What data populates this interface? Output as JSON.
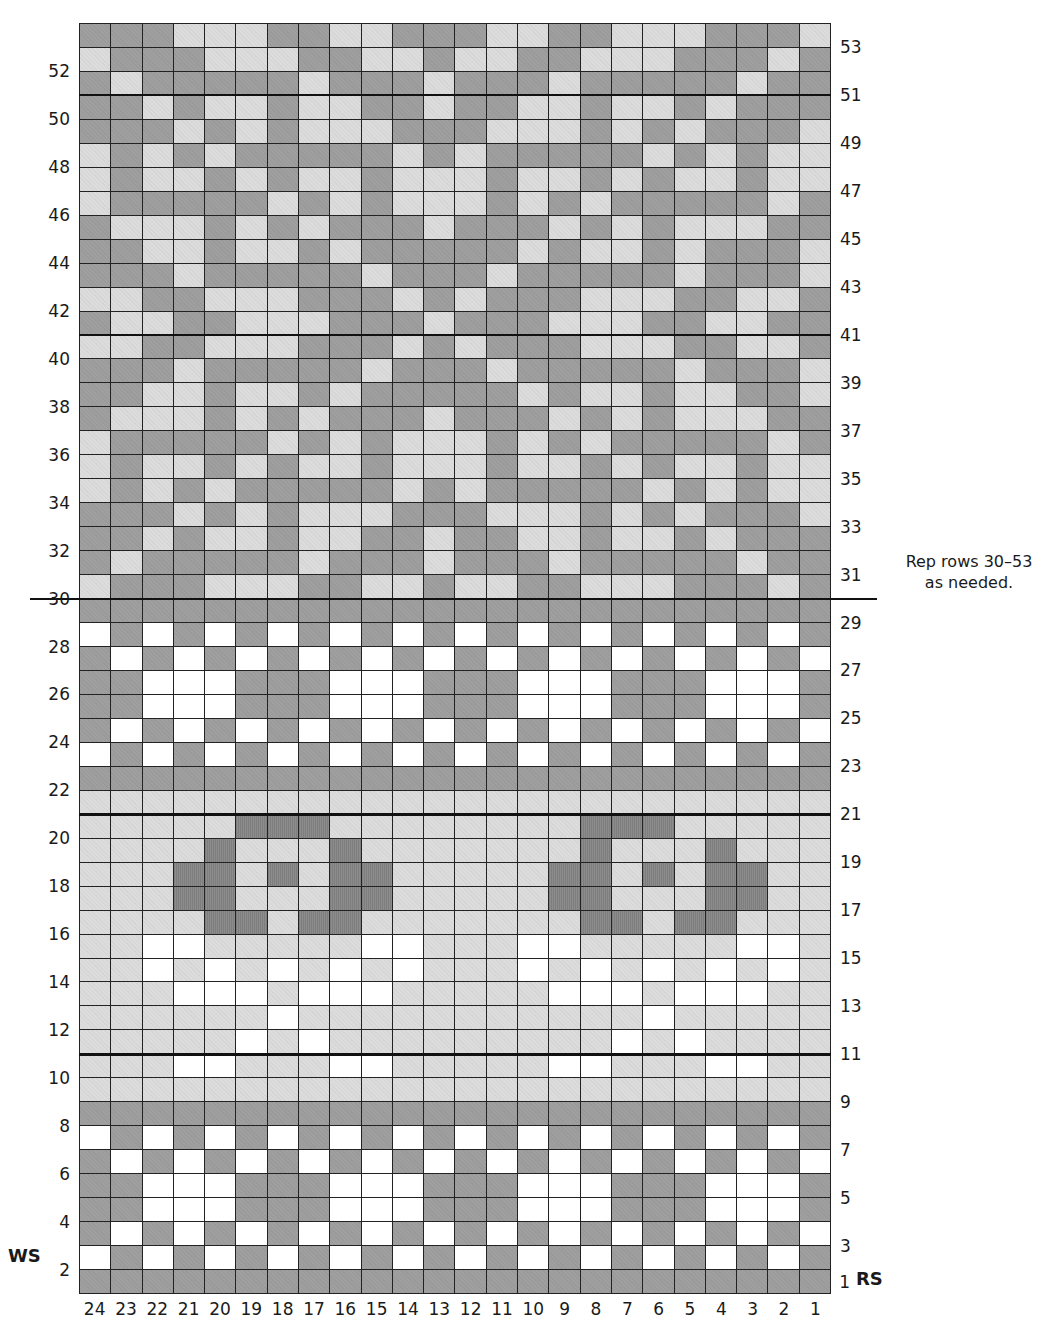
{
  "colors": {
    "D": "#9f9f9f",
    "L": "#dcdcdc",
    "W": "#ffffff",
    "X": "#8c8c8c",
    "grid_line": "#222222"
  },
  "legend_keys": {
    "D": "medium-dark grey",
    "L": "light grey",
    "W": "white",
    "X": "dark grey (hatched)"
  },
  "chart": {
    "columns": 24,
    "rows": 53,
    "column_order_left_to_right": [
      24,
      23,
      22,
      21,
      20,
      19,
      18,
      17,
      16,
      15,
      14,
      13,
      12,
      11,
      10,
      9,
      8,
      7,
      6,
      5,
      4,
      3,
      2,
      1
    ],
    "rows_top_to_bottom": [
      {
        "row": 53,
        "cells": "DDDLLLDDLLDDDLLDDLLLDDDL"
      },
      {
        "row": 52,
        "cells": "LDDDLLLDDLLDLLDDLLLDDDLD"
      },
      {
        "row": 51,
        "cells": "DLDDDDDLDDDLDDDLDDDDDLDD"
      },
      {
        "row": 50,
        "cells": "DDLDLLDLLDDLDDLLDLLDLDDD"
      },
      {
        "row": 49,
        "cells": "DDDLDLDLLLDDDLLLDLDLDDDL"
      },
      {
        "row": 48,
        "cells": "LDLDLDDDDDLDLDDDDDLDLDLL"
      },
      {
        "row": 47,
        "cells": "LDLLDLDLLDLLLDLLDLDLLDLL"
      },
      {
        "row": 46,
        "cells": "LDDDDDLDLDLLLDLDLDDDDDLD"
      },
      {
        "row": 45,
        "cells": "DLLLDLDLDDDLDDDLDLDLLLDD"
      },
      {
        "row": 44,
        "cells": "DDLLDLLDLDDDDDLDLLDLDDDL"
      },
      {
        "row": 43,
        "cells": "DDDLDDDDDLDDDLDDDDDLDDDL"
      },
      {
        "row": 42,
        "cells": "LLDDLLLDDDLDLDDDLLLDDLLD"
      },
      {
        "row": 41,
        "cells": "DLLDDLLLDDDLDDDLLLDDLLDD"
      },
      {
        "row": 40,
        "cells": "LLDDLLLDDDLDLDDDLLLDDLLD"
      },
      {
        "row": 39,
        "cells": "DDDLDDDDDLDDDLDDDDDLDDDL"
      },
      {
        "row": 38,
        "cells": "DDLLDLLDLDDDDDLDLLDLLDDL"
      },
      {
        "row": 37,
        "cells": "DLLLDLDLDDDLDDDLDLDLLLDD"
      },
      {
        "row": 36,
        "cells": "LDDDDDLDLDLLLDLDLDDDDDLD"
      },
      {
        "row": 35,
        "cells": "LDLLDLDLLDLLLDLLDLDLLDLL"
      },
      {
        "row": 34,
        "cells": "LDLDLDDDDDLDLDDDDDLDLDLL"
      },
      {
        "row": 33,
        "cells": "DDDLDLDLLLDDDLLLDLDLDDDL"
      },
      {
        "row": 32,
        "cells": "DDLDLLDLLDDLDDLLDLLDLDDD"
      },
      {
        "row": 31,
        "cells": "DLDDDDDLDDDLDDDLDDDDDLDD"
      },
      {
        "row": 30,
        "cells": "LDDDLLLDDLLDLLDDLLLDDDLD"
      },
      {
        "row": 29,
        "cells": "DDDDDDDDDDDDDDDDDDDDDDDD"
      },
      {
        "row": 28,
        "cells": "WDWDWDWDWDWDWDWDWDWDWDWD"
      },
      {
        "row": 27,
        "cells": "DWDWDWDWDWDWDWDWDWDWDWDW"
      },
      {
        "row": 26,
        "cells": "DDWWWDDDWWWDDDWWWDDDWWWD"
      },
      {
        "row": 25,
        "cells": "DDWWWDDDWWWDDDWWWDDDWWWD"
      },
      {
        "row": 24,
        "cells": "DWDWDWDWDWDWDWDWDWDWDWDW"
      },
      {
        "row": 23,
        "cells": "WDWDWDWDWDWDWDWDWDWDWDWD"
      },
      {
        "row": 22,
        "cells": "DDDDDDDDDDDDDDDDDDDDDDDD"
      },
      {
        "row": 21,
        "cells": "LLLLLLLLLLLLLLLLLLLLLLLL"
      },
      {
        "row": 20,
        "cells": "LLLLLXXXLLLLLLLLXXXLLLLL"
      },
      {
        "row": 19,
        "cells": "LLLLXLLLXLLLLLLLXLLLXLLL"
      },
      {
        "row": 18,
        "cells": "LLLXXLXLXXLLLLLXXLXLXXLL"
      },
      {
        "row": 17,
        "cells": "LLLXXLLLXXLLLLLXXLLLXXLL"
      },
      {
        "row": 16,
        "cells": "LLLLXXLXXLLLLLLLXXLXXLLL"
      },
      {
        "row": 15,
        "cells": "LLWWLLLLLWWLLLWWLLLLLWWL"
      },
      {
        "row": 14,
        "cells": "LLWLWLWLWLWLLLWLWLWLWLWL"
      },
      {
        "row": 13,
        "cells": "LLLWWWLWWWLLLLLWWWLWWWLL"
      },
      {
        "row": 12,
        "cells": "LLLLLLWLLLLLLLLLLLWLLLLL"
      },
      {
        "row": 11,
        "cells": "LLLLLWLWLLLLLLLLLWLWLLLL"
      },
      {
        "row": 10,
        "cells": "LLLWWLLLWWLLLLLWWLLLWWLL"
      },
      {
        "row": 9,
        "cells": "LLLLLLLLLLLLLLLLLLLLLLLL"
      },
      {
        "row": 8,
        "cells": "DDDDDDDDDDDDDDDDDDDDDDDD"
      },
      {
        "row": 7,
        "cells": "WDWDWDWDWDWDWDWDWDWDWDWD"
      },
      {
        "row": 6,
        "cells": "DWDWDWDWDWDWDWDWDWDWDWDW"
      },
      {
        "row": 5,
        "cells": "DDWWWDDDWWWDDDWWWDDDWWWD"
      },
      {
        "row": 4,
        "cells": "DDWWWDDDWWWDDDWWWDDDWWWD"
      },
      {
        "row": 3,
        "cells": "DWDWDWDWDWDWDWDWDWDWDWDW"
      },
      {
        "row": 2,
        "cells": "WDWDWDWDWDWDWDWDWDWDWDWD"
      },
      {
        "row": 1,
        "cells": "DDDDDDDDDDDDDDDDDDDDDDDD"
      }
    ],
    "heavy_lines_above_rows": [
      10,
      20,
      40,
      50
    ],
    "extended_line_above_row": 29
  },
  "labels": {
    "left_rows": [
      "52",
      "50",
      "48",
      "46",
      "44",
      "42",
      "40",
      "38",
      "36",
      "34",
      "32",
      "30",
      "28",
      "26",
      "24",
      "22",
      "20",
      "18",
      "16",
      "14",
      "12",
      "10",
      "8",
      "6",
      "4",
      "2"
    ],
    "right_rows": [
      "53",
      "51",
      "49",
      "47",
      "45",
      "43",
      "41",
      "39",
      "37",
      "35",
      "33",
      "31",
      "29",
      "27",
      "25",
      "23",
      "21",
      "19",
      "17",
      "15",
      "13",
      "11",
      "9",
      "7",
      "5",
      "3",
      "1"
    ],
    "columns": [
      "24",
      "23",
      "22",
      "21",
      "20",
      "19",
      "18",
      "17",
      "16",
      "15",
      "14",
      "13",
      "12",
      "11",
      "10",
      "9",
      "8",
      "7",
      "6",
      "5",
      "4",
      "3",
      "2",
      "1"
    ],
    "ws": "WS",
    "rs": "RS"
  },
  "note": {
    "line1": "Rep rows 30–53",
    "line2": "as needed."
  }
}
